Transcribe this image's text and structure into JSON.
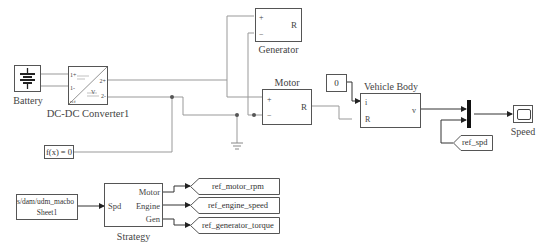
{
  "blocks": {
    "battery": {
      "label": "Battery"
    },
    "converter": {
      "label": "DC-DC Converter1",
      "ports": {
        "in_plus": "1+",
        "in_minus": "1-",
        "out_plus": "2+",
        "out_minus": "2-",
        "ref": "ref",
        "v": "V"
      }
    },
    "generator": {
      "label": "Generator",
      "ports": {
        "plus": "+",
        "minus": "−",
        "R": "R"
      }
    },
    "motor": {
      "label": "Motor",
      "ports": {
        "plus": "+",
        "minus": "−",
        "R": "R"
      }
    },
    "constant": {
      "value": "0"
    },
    "vehicle_body": {
      "label": "Vehicle Body",
      "ports": {
        "i": "i",
        "R": "R",
        "v": "v"
      }
    },
    "scope": {
      "label": "Speed"
    },
    "solver": {
      "label": "f(x) = 0"
    },
    "from_spd": {
      "label": "ref_spd"
    },
    "from_workspace": {
      "line1": "s/dam/udm_macbo",
      "line2": "Sheet1"
    },
    "strategy": {
      "label": "Strategy",
      "ports": {
        "in": "Spd",
        "out1": "Motor",
        "out2": "Engine",
        "out3": "Gen"
      }
    },
    "goto_tags": [
      {
        "label": "ref_motor_rpm"
      },
      {
        "label": "ref_engine_speed"
      },
      {
        "label": "ref_generator_torque"
      }
    ]
  },
  "colors": {
    "wire": "#888888",
    "signal": "#333333",
    "block_border": "#555555"
  }
}
